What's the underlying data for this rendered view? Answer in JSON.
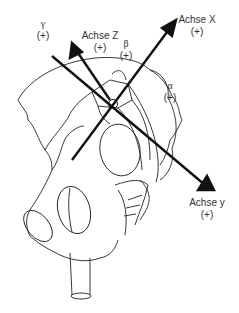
{
  "diagram": {
    "colors": {
      "line": "#111111",
      "text": "#333333",
      "background": "#ffffff"
    },
    "labels": {
      "axis_x": {
        "name": "Achse X",
        "sign": "(+)"
      },
      "axis_y": {
        "name": "Achse y",
        "sign": "(+)"
      },
      "axis_z": {
        "name": "Achse Z",
        "sign": "(+)"
      },
      "alpha": {
        "name": "α",
        "sign": "(+)"
      },
      "beta": {
        "name": "β",
        "sign": "(+)"
      },
      "gamma": {
        "name": "γ",
        "sign": "(+)"
      }
    }
  }
}
